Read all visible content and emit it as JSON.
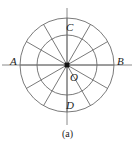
{
  "figure": {
    "caption": "(a)",
    "center": {
      "x": 67,
      "y": 65
    },
    "colors": {
      "stroke": "#6b6b6b",
      "axis": "#8a8a8a",
      "text": "#1d1d1d",
      "center_dot": "#141414",
      "background": "#ffffff"
    },
    "circles": [
      {
        "name": "outer-circle",
        "radius": 47
      },
      {
        "name": "inner-circle",
        "radius": 30
      }
    ],
    "spokes": {
      "count": 12,
      "angle_step_degrees": 30,
      "angles_degrees": [
        0,
        30,
        60,
        90,
        120,
        150,
        180,
        210,
        240,
        270,
        300,
        330
      ]
    },
    "axes": {
      "horizontal": {
        "label_left": "A",
        "label_right": "B",
        "x_start": 2,
        "x_end": 132,
        "y": 65
      },
      "vertical": {
        "label_top": "C",
        "label_bottom": "D",
        "y_start": 8,
        "y_end": 125,
        "x": 67
      }
    },
    "labels": {
      "A": "A",
      "B": "B",
      "C": "C",
      "D": "D",
      "O": "O"
    }
  }
}
